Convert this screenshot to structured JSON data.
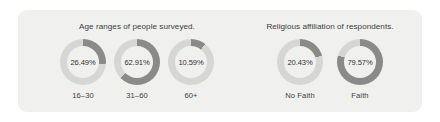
{
  "card": {
    "background_color": "#f0f0ef"
  },
  "theme": {
    "track_color": "#d6d6d4",
    "fill_color": "#8a8a8a",
    "text_color": "#3d3d3d"
  },
  "panels": [
    {
      "id": "age",
      "title": "Age ranges of people surveyed.",
      "items": [
        {
          "label": "16–30",
          "value_label": "26.49%",
          "value": 26.49
        },
        {
          "label": "31–60",
          "value_label": "62.91%",
          "value": 62.91
        },
        {
          "label": "60+",
          "value_label": "10.59%",
          "value": 10.59
        }
      ]
    },
    {
      "id": "religion",
      "title": "Religious affiliation of respondents.",
      "items": [
        {
          "label": "No Faith",
          "value_label": "20.43%",
          "value": 20.43
        },
        {
          "label": "Faith",
          "value_label": "79.57%",
          "value": 79.57
        }
      ]
    }
  ],
  "chart_data": {
    "type": "pie",
    "charts": [
      {
        "type": "pie",
        "subtype": "donut",
        "title": "Age ranges of people surveyed.",
        "categories": [
          "16–30",
          "31–60",
          "60+"
        ],
        "values": [
          26.49,
          62.91,
          10.59
        ],
        "unit": "percent",
        "labels": [
          "26.49%",
          "62.91%",
          "10.59%"
        ],
        "legend": "none",
        "grid": false
      },
      {
        "type": "pie",
        "subtype": "donut",
        "title": "Religious affiliation of respondents.",
        "categories": [
          "No Faith",
          "Faith"
        ],
        "values": [
          20.43,
          79.57
        ],
        "unit": "percent",
        "labels": [
          "20.43%",
          "79.57%"
        ],
        "legend": "none",
        "grid": false
      }
    ]
  }
}
